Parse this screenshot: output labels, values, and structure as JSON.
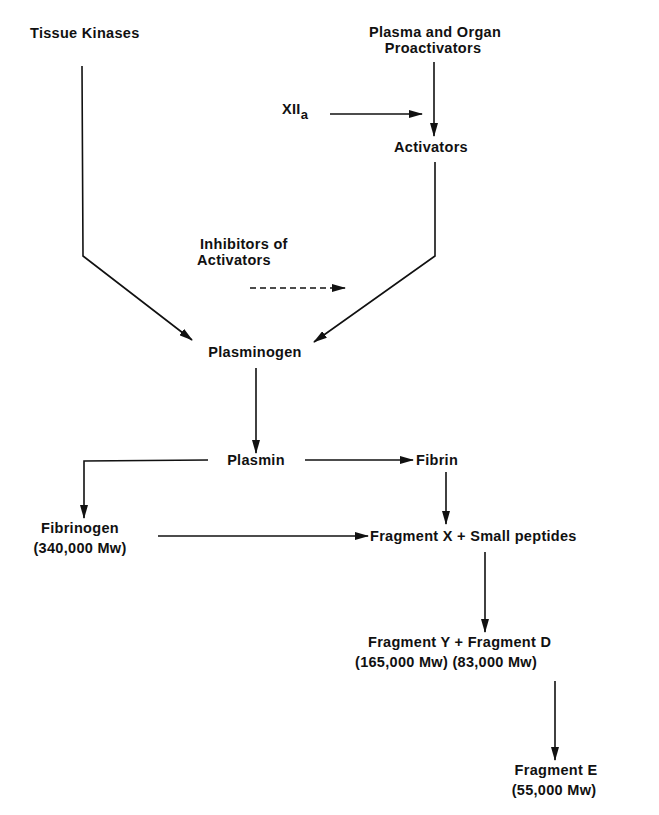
{
  "diagram": {
    "nodes": {
      "tissue_kinases": "Tissue Kinases",
      "proactivators_line1": "Plasma and Organ",
      "proactivators_line2": "Proactivators",
      "xii_main": "XII",
      "xii_sub": "a",
      "activators": "Activators",
      "inhibitors_line1": "Inhibitors of",
      "inhibitors_line2": "Activators",
      "plasminogen": "Plasminogen",
      "plasmin": "Plasmin",
      "fibrin": "Fibrin",
      "fibrinogen": "Fibrinogen",
      "fibrinogen_mw": "(340,000 Mw)",
      "fragment_x": "Fragment X + Small peptides",
      "fragment_yd": "Fragment Y + Fragment D",
      "fragment_yd_mw": "(165,000 Mw) (83,000 Mw)",
      "fragment_e": "Fragment E",
      "fragment_e_mw": "(55,000 Mw)"
    },
    "edges": [
      {
        "from": "Tissue Kinases",
        "to": "Plasminogen",
        "style": "solid"
      },
      {
        "from": "Plasma and Organ Proactivators",
        "to": "Activators",
        "style": "solid"
      },
      {
        "from": "XIIa",
        "to": "Activators",
        "style": "solid"
      },
      {
        "from": "Activators",
        "to": "Plasminogen",
        "style": "solid"
      },
      {
        "from": "Inhibitors of Activators",
        "to": "Activators pathway",
        "style": "dashed"
      },
      {
        "from": "Plasminogen",
        "to": "Plasmin",
        "style": "solid"
      },
      {
        "from": "Plasmin",
        "to": "Fibrin",
        "style": "solid"
      },
      {
        "from": "Plasmin",
        "to": "Fibrinogen",
        "style": "solid"
      },
      {
        "from": "Fibrin",
        "to": "Fragment X + Small peptides",
        "style": "solid"
      },
      {
        "from": "Fibrinogen",
        "to": "Fragment X + Small peptides",
        "style": "solid"
      },
      {
        "from": "Fragment X",
        "to": "Fragment Y + Fragment D",
        "style": "solid"
      },
      {
        "from": "Fragment D",
        "to": "Fragment E",
        "style": "solid"
      }
    ],
    "colors": {
      "ink": "#111111",
      "background": "#ffffff"
    }
  }
}
